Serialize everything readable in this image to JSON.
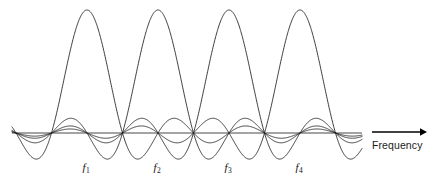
{
  "figure": {
    "title": "",
    "background_color": "#ffffff",
    "line_color": "#1a1a1a",
    "width": 439,
    "height": 186
  },
  "axis": {
    "frequency_label": "Frequency",
    "arrow_name": "frequency-arrow",
    "baseline_y": 133
  },
  "carriers": [
    {
      "label": "f",
      "subscript": "1",
      "center_x": 87,
      "label_x": 86,
      "label_y": 161
    },
    {
      "label": "f",
      "subscript": "2",
      "center_x": 158,
      "label_x": 157,
      "label_y": 161
    },
    {
      "label": "f",
      "subscript": "3",
      "center_x": 229,
      "label_x": 228,
      "label_y": 161
    },
    {
      "label": "f",
      "subscript": "4",
      "center_x": 300,
      "label_x": 299,
      "label_y": 161
    }
  ],
  "chart_data": {
    "type": "line",
    "xlabel": "Frequency",
    "ylabel": "",
    "x_range": [
      12,
      362
    ],
    "y_baseline": 133,
    "peak_amplitude_px": 123,
    "subcarrier_spacing_px": 71,
    "null_spacing_px": 35.5,
    "series": [
      {
        "name": "f1",
        "center_x": 87,
        "peak_y": 10,
        "peak_value": 1.0
      },
      {
        "name": "f2",
        "center_x": 158,
        "peak_y": 10,
        "peak_value": 1.0
      },
      {
        "name": "f3",
        "center_x": 229,
        "peak_y": 10,
        "peak_value": 1.0
      },
      {
        "name": "f4",
        "center_x": 300,
        "peak_y": 10,
        "peak_value": 1.0
      }
    ],
    "legend": [],
    "grid": false
  }
}
